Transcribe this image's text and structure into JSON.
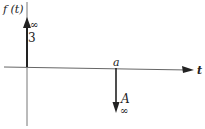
{
  "diagram": {
    "y_axis_label": "f (t)",
    "x_axis_label": "t",
    "impulses": [
      {
        "position_label": "",
        "weight": "3",
        "symbol": "∞",
        "direction": "up"
      },
      {
        "position_label": "a",
        "weight": "A",
        "symbol": "∞",
        "direction": "down"
      }
    ],
    "colors": {
      "ink": "#222222",
      "axis": "#555555"
    }
  }
}
